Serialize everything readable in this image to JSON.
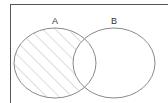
{
  "diagram": {
    "type": "venn",
    "sets": [
      {
        "label": "A",
        "cx": 55,
        "cy": 63,
        "rx": 41,
        "ry": 35
      },
      {
        "label": "B",
        "cx": 114,
        "cy": 63,
        "rx": 41,
        "ry": 35
      }
    ],
    "shaded_region": "A minus B",
    "colors": {
      "outline": "#8a8a8a",
      "hatch": "#c8c8c8",
      "frame": "#555555",
      "background": "#ffffff"
    }
  }
}
